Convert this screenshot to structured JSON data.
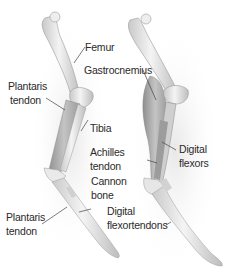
{
  "diagram": {
    "left_leg": {
      "labels": {
        "femur": "Femur",
        "plantaris_tendon_upper_1": "Plantaris",
        "plantaris_tendon_upper_2": "tendon",
        "tibia": "Tibia",
        "cannon_bone_1": "Cannon",
        "cannon_bone_2": "bone",
        "plantaris_tendon_lower_1": "Plantaris",
        "plantaris_tendon_lower_2": "tendon"
      }
    },
    "right_leg": {
      "labels": {
        "gastrocnemius": "Gastrocnemius",
        "achilles_tendon_1": "Achilles",
        "achilles_tendon_2": "tendon",
        "digital_flexors_1": "Digital",
        "digital_flexors_2": "flexors",
        "digital_flexortendons_1": "Digital",
        "digital_flexortendons_2": "flexortendons"
      }
    },
    "colors": {
      "bone": "#e9e9e9",
      "bone_shade": "#b8b8b8",
      "muscle": "#a9a9a9",
      "text": "#2a2a2a",
      "leader": "#444444"
    }
  }
}
